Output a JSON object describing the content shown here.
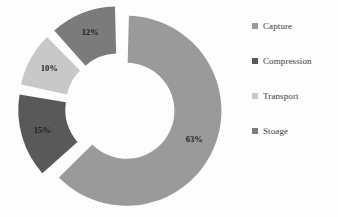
{
  "chart_data": {
    "type": "pie",
    "variant": "doughnut-exploded",
    "title": "",
    "subtitle": "",
    "xlabel": "",
    "ylabel": "",
    "grid": false,
    "legend_position": "right",
    "categories": [
      "Capture",
      "Compression",
      "Transport",
      "Stoage"
    ],
    "values": [
      63,
      15,
      10,
      12
    ],
    "value_labels": [
      "63%",
      "15%",
      "10%",
      "12%"
    ],
    "units": "percent",
    "total": 100,
    "colors": [
      "#9a9a9a",
      "#595959",
      "#c8c8c8",
      "#7b7b7b"
    ],
    "series": [
      {
        "name": "Share",
        "values": [
          63,
          15,
          10,
          12
        ]
      }
    ],
    "slices": [
      {
        "name": "Capture",
        "value": 63,
        "label": "63%",
        "color": "#9a9a9a",
        "start_angle_deg": 0,
        "end_angle_deg": 226.8,
        "exploded": true
      },
      {
        "name": "Compression",
        "value": 15,
        "label": "15%",
        "color": "#595959",
        "start_angle_deg": 226.8,
        "end_angle_deg": 280.8,
        "exploded": true
      },
      {
        "name": "Transport",
        "value": 10,
        "label": "10%",
        "color": "#c8c8c8",
        "start_angle_deg": 280.8,
        "end_angle_deg": 316.8,
        "exploded": true
      },
      {
        "name": "Stoage",
        "value": 12,
        "label": "12%",
        "color": "#7b7b7b",
        "start_angle_deg": 316.8,
        "end_angle_deg": 360,
        "exploded": true
      }
    ]
  },
  "legend": {
    "items": [
      {
        "label": "Capture",
        "color": "#9a9a9a"
      },
      {
        "label": "Compression",
        "color": "#595959"
      },
      {
        "label": "Transport",
        "color": "#c8c8c8"
      },
      {
        "label": "Stoage",
        "color": "#7b7b7b"
      }
    ]
  }
}
